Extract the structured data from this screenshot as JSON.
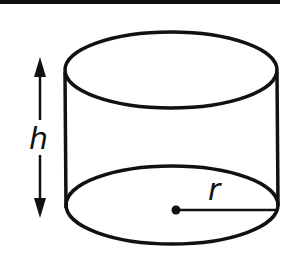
{
  "diagram": {
    "type": "cylinder",
    "labels": {
      "height": "h",
      "radius": "r"
    },
    "colors": {
      "stroke": "#111111",
      "background": "#ffffff"
    }
  }
}
